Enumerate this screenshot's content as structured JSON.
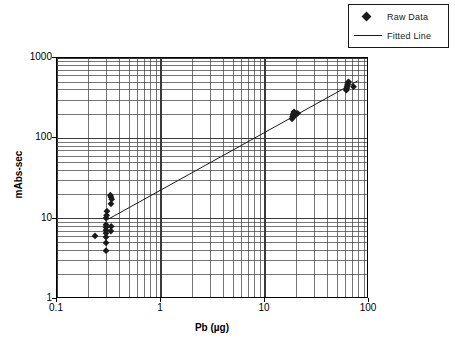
{
  "chart_data": {
    "type": "scatter",
    "title": "",
    "xlabel": "Pb (µg)",
    "ylabel": "mAbs-sec",
    "xscale": "log",
    "yscale": "log",
    "xlim": [
      0.1,
      100
    ],
    "ylim": [
      1,
      1000
    ],
    "xticks": [
      "0.1",
      "1",
      "10",
      "100"
    ],
    "yticks": [
      "1",
      "10",
      "100",
      "1000"
    ],
    "grid": "both-major-and-minor",
    "legend_position": "top-right-outside",
    "series": [
      {
        "name": "Raw Data",
        "type": "scatter",
        "marker": "diamond",
        "color": "#1a1a1a",
        "points": [
          [
            0.232,
            6.1
          ],
          [
            0.296,
            4.0
          ],
          [
            0.296,
            5.0
          ],
          [
            0.296,
            5.9
          ],
          [
            0.296,
            6.6
          ],
          [
            0.296,
            7.2
          ],
          [
            0.296,
            7.8
          ],
          [
            0.296,
            8.4
          ],
          [
            0.296,
            10.2
          ],
          [
            0.3,
            11.0
          ],
          [
            0.302,
            12.4
          ],
          [
            0.33,
            7.0
          ],
          [
            0.332,
            8.0
          ],
          [
            0.33,
            15.3
          ],
          [
            0.336,
            17.5
          ],
          [
            0.33,
            18.6
          ],
          [
            0.326,
            19.6
          ],
          [
            18.2,
            175.0
          ],
          [
            18.4,
            186.0
          ],
          [
            18.6,
            196.0
          ],
          [
            18.8,
            205.0
          ],
          [
            19.0,
            214.0
          ],
          [
            19.4,
            192.0
          ],
          [
            20.6,
            205.0
          ],
          [
            60.5,
            398.0
          ],
          [
            61.0,
            420.0
          ],
          [
            61.5,
            440.0
          ],
          [
            62.0,
            462.0
          ],
          [
            62.5,
            487.0
          ],
          [
            63.5,
            505.0
          ],
          [
            71.0,
            440.0
          ]
        ]
      },
      {
        "name": "Fitted Line",
        "type": "line",
        "color": "#1a1a1a",
        "endpoints": [
          [
            0.3,
            9.6
          ],
          [
            78.0,
            520.0
          ]
        ]
      }
    ]
  },
  "legend": {
    "items": [
      {
        "label": "Raw Data",
        "key": "diamond-marker"
      },
      {
        "label": "Fitted Line",
        "key": "line-swatch"
      }
    ]
  },
  "axes": {
    "x": {
      "label": "Pb (µg)",
      "ticks": [
        {
          "value": 0.1,
          "label": "0.1"
        },
        {
          "value": 1,
          "label": "1"
        },
        {
          "value": 10,
          "label": "10"
        },
        {
          "value": 100,
          "label": "100"
        }
      ]
    },
    "y": {
      "label": "mAbs-sec",
      "ticks": [
        {
          "value": 1,
          "label": "1"
        },
        {
          "value": 10,
          "label": "10"
        },
        {
          "value": 100,
          "label": "100"
        },
        {
          "value": 1000,
          "label": "1000"
        }
      ]
    }
  },
  "colors": {
    "marker": "#1a1a1a",
    "line": "#1a1a1a",
    "grid": "#3a3a3a",
    "axis": "#000000",
    "background": "#ffffff"
  }
}
